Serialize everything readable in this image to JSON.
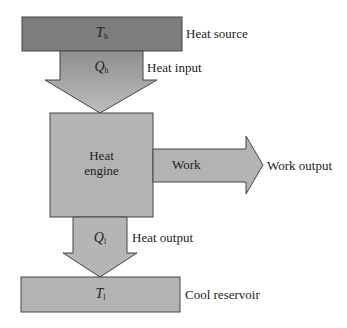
{
  "colors": {
    "hot": "#7a7a7a",
    "gray": "#b3b3b3",
    "stroke": "#444444",
    "arrow_top": "#9c9c9c",
    "arrow_bottom": "#c4c4c4"
  },
  "source": {
    "symbol": "T",
    "sub": "h",
    "label": "Heat source"
  },
  "input": {
    "symbol": "Q",
    "sub": "h",
    "label": "Heat input"
  },
  "engine": {
    "line1": "Heat",
    "line2": "engine"
  },
  "work": {
    "inner": "Work",
    "label": "Work output"
  },
  "output": {
    "symbol": "Q",
    "sub": "l",
    "label": "Heat output"
  },
  "reservoir": {
    "symbol": "T",
    "sub": "l",
    "label": "Cool reservoir"
  }
}
